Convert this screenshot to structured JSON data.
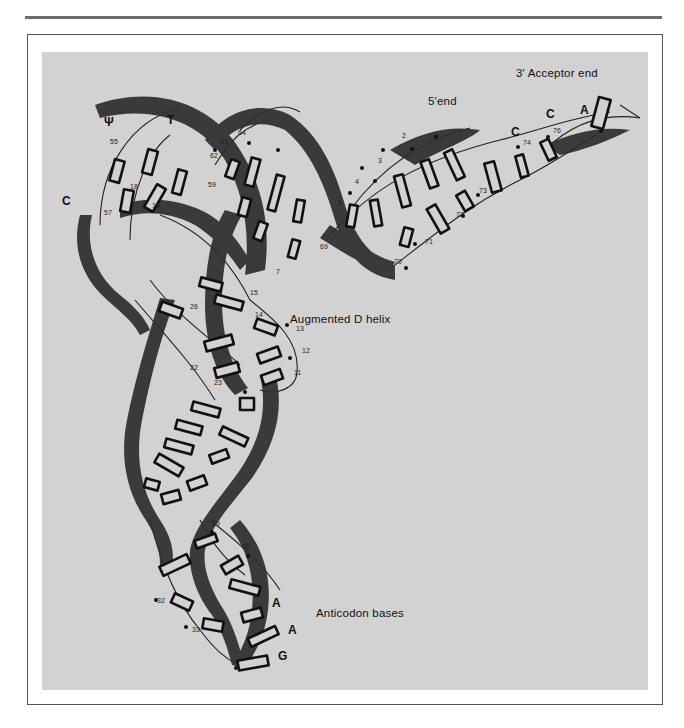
{
  "figure": {
    "colors": {
      "background": "#ffffff",
      "panel": "#d2d2d2",
      "ribbon": "#2e2e2e",
      "ink": "#111111",
      "rule": "#6e6e6e"
    },
    "labels": {
      "acceptor_end": "3′ Acceptor end",
      "five_prime_end": "5′end",
      "augmented_d_helix": "Augmented D helix",
      "anticodon_bases": "Anticodon bases",
      "psi": "Ψ",
      "t": "T",
      "c_loop": "C"
    },
    "acceptor_bases": [
      "C",
      "C",
      "A"
    ],
    "anticodon_bases": [
      "A",
      "A",
      "G"
    ],
    "residue_numbers": {
      "n2": "2",
      "n3": "3",
      "n4": "4",
      "n5": "5",
      "n7": "7",
      "n11": "11",
      "n12": "12",
      "n13": "13",
      "n14": "14",
      "n15": "15",
      "n18": "18",
      "n19": "19",
      "n22": "22",
      "n23": "23",
      "n26": "26",
      "n32": "32",
      "n33": "33",
      "n38": "38",
      "n39": "39",
      "n55": "55",
      "n57": "57",
      "n59": "59",
      "n62": "62",
      "n63": "63",
      "n64": "64",
      "n69": "69",
      "n70": "70",
      "n71": "71",
      "n72": "72",
      "n73": "73",
      "n74": "74",
      "n76": "76"
    }
  }
}
